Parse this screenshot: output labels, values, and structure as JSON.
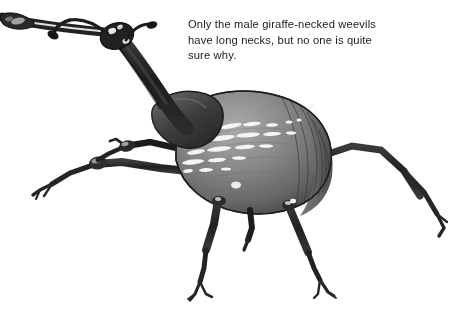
{
  "page": {
    "width": 450,
    "height": 316,
    "background_color": "#ffffff"
  },
  "caption": {
    "text": "Only the male giraffe-necked weevils\nhave long necks, but no one is quite\nsure why.",
    "lines": [
      "Only the male giraffe-necked weevils",
      "have long necks, but no one is quite",
      "sure why."
    ],
    "color": "#1b1b1b"
  },
  "illustration": {
    "subject": "giraffe-necked-weevil",
    "style": "grayscale-halftone-drawing",
    "colors": {
      "body_midtone": "#8d8d8d",
      "body_shadow": "#4a4a4a",
      "body_dark": "#2a2a2a",
      "highlight": "#ffffff",
      "limb_dark": "#252525",
      "limb_mid": "#555555",
      "outline": "#1a1a1a"
    },
    "parts": [
      {
        "name": "rostrum",
        "label": "rostrum-snout"
      },
      {
        "name": "head",
        "label": "head"
      },
      {
        "name": "antenna-left",
        "label": "left-antenna"
      },
      {
        "name": "antenna-right",
        "label": "right-antenna"
      },
      {
        "name": "neck",
        "label": "elongated-neck"
      },
      {
        "name": "pronotum",
        "label": "pronotum"
      },
      {
        "name": "elytra",
        "label": "elytra-wing-cases"
      },
      {
        "name": "elytra-highlights",
        "label": "elytra-highlight-streaks"
      },
      {
        "name": "leg-front-left",
        "label": "front-left-leg"
      },
      {
        "name": "leg-front-right",
        "label": "front-right-leg"
      },
      {
        "name": "leg-mid-left",
        "label": "middle-left-leg"
      },
      {
        "name": "leg-mid-right",
        "label": "middle-right-leg"
      },
      {
        "name": "leg-hind-left",
        "label": "hind-left-leg"
      },
      {
        "name": "leg-hind-right",
        "label": "hind-right-leg"
      }
    ]
  }
}
